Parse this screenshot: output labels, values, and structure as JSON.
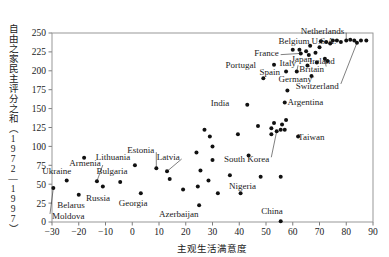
{
  "chart_data": {
    "type": "scatter",
    "title": "",
    "xlabel": "主观生活满意度",
    "ylabel": "自由之家民主评分之和（1972—1997）",
    "xlim": [
      -30,
      90
    ],
    "ylim": [
      0,
      250
    ],
    "xticks": [
      -30,
      -20,
      -10,
      0,
      10,
      20,
      30,
      40,
      50,
      60,
      70,
      80,
      90
    ],
    "xtick_labels": [
      "−30",
      "−20",
      "−10",
      "0",
      "10",
      "20",
      "30",
      "40",
      "50",
      "60",
      "70",
      "80",
      "90"
    ],
    "yticks": [
      0,
      25,
      50,
      75,
      100,
      125,
      150,
      175,
      200,
      225,
      250
    ],
    "ytick_labels": [
      "0",
      "25",
      "50",
      "75",
      "100",
      "125",
      "150",
      "175",
      "200",
      "225",
      "250"
    ],
    "grid": false,
    "legend": "none",
    "marker": "filled-circle",
    "marker_color": "#111111",
    "points": [
      {
        "name": "Moldova",
        "x": -29.5,
        "y": 45,
        "label": "Moldova",
        "label_x": -28.5,
        "label_y": 8,
        "leader": true
      },
      {
        "name": "Ukraine",
        "x": -24.5,
        "y": 55,
        "label": "Ukraine",
        "label_x": -28.0,
        "label_y": 67,
        "leader": false
      },
      {
        "name": "Belarus",
        "x": -20.0,
        "y": 36,
        "label": "Belarus",
        "label_x": -23.0,
        "label_y": 22,
        "leader": false
      },
      {
        "name": "Armenia",
        "x": -13.2,
        "y": 54,
        "label": "Armenia",
        "label_x": -17.0,
        "label_y": 78,
        "leader": true
      },
      {
        "name": "Russia",
        "x": -11.0,
        "y": 47,
        "label": "Russia",
        "label_x": -13.5,
        "label_y": 32,
        "leader": false
      },
      {
        "name": "Bulgaria",
        "x": -4.5,
        "y": 53,
        "label": "Bulgaria",
        "label_x": -7.0,
        "label_y": 67,
        "leader": false
      },
      {
        "name": "Lithuania",
        "x": 1.0,
        "y": 75,
        "label": "Lithuania",
        "label_x": -6.0,
        "label_y": 86,
        "leader": false
      },
      {
        "name": "Georgia",
        "x": 3.2,
        "y": 38,
        "label": "Georgia",
        "label_x": 0.5,
        "label_y": 25,
        "leader": false
      },
      {
        "name": "Estonia",
        "x": 9.0,
        "y": 71,
        "label": "Estonia",
        "label_x": 3.0,
        "label_y": 95,
        "leader": true
      },
      {
        "name": "Latvia",
        "x": 13.0,
        "y": 67,
        "label": "Latvia",
        "label_x": 12.5,
        "label_y": 86,
        "leader": true
      },
      {
        "name": "Azerbaijan",
        "x": 25.0,
        "y": 22,
        "label": "Azerbaijan",
        "label_x": 19.5,
        "label_y": 11,
        "leader": false
      },
      {
        "name": "India",
        "x": 43.0,
        "y": 155,
        "label": "India",
        "label_x": 31.0,
        "label_y": 157,
        "leader": false
      },
      {
        "name": "Nigeria",
        "x": 48.0,
        "y": 60,
        "label": "Nigeria",
        "label_x": 41.0,
        "label_y": 48,
        "leader": false
      },
      {
        "name": "China",
        "x": 55.5,
        "y": 1,
        "label": "China",
        "label_x": 51.0,
        "label_y": 14,
        "leader": false
      },
      {
        "name": "South Korea",
        "x": 54.0,
        "y": 120,
        "label": "South Korea",
        "label_x": 46.0,
        "label_y": 83,
        "leader": true
      },
      {
        "name": "Argentina",
        "x": 57.0,
        "y": 158,
        "label": "Argentina",
        "label_x": 59.5,
        "label_y": 159,
        "leader": false
      },
      {
        "name": "Taiwan",
        "x": 62.0,
        "y": 113,
        "label": "Taiwan",
        "label_x": 63.5,
        "label_y": 112,
        "leader": false
      },
      {
        "name": "Portugal",
        "x": 53.0,
        "y": 208,
        "label": "Portugal",
        "label_x": 41.0,
        "label_y": 208,
        "leader": false
      },
      {
        "name": "Spain",
        "x": 57.5,
        "y": 199,
        "label": "Spain",
        "label_x": 50.0,
        "label_y": 198,
        "leader": false
      },
      {
        "name": "Italy",
        "x": 61.5,
        "y": 199,
        "label": "Italy",
        "label_x": 56.0,
        "label_y": 210,
        "leader": true
      },
      {
        "name": "France",
        "x": 63.0,
        "y": 223,
        "label": "France",
        "label_x": 49.5,
        "label_y": 224,
        "leader": true
      },
      {
        "name": "Japan",
        "x": 68.5,
        "y": 224,
        "label": "Japan",
        "label_x": 62.0,
        "label_y": 216,
        "leader": false
      },
      {
        "name": "Belgium",
        "x": 70.5,
        "y": 239,
        "label": "Belgium",
        "label_x": 61.0,
        "label_y": 240,
        "leader": false
      },
      {
        "name": "Germany",
        "x": 67.0,
        "y": 193,
        "label": "Germany",
        "label_x": 62.0,
        "label_y": 189,
        "leader": true
      },
      {
        "name": "Britain",
        "x": 72.0,
        "y": 216,
        "label": "Britain",
        "label_x": 66.5,
        "label_y": 203,
        "leader": true
      },
      {
        "name": "Ireland",
        "x": 73.0,
        "y": 213,
        "label": "Ireland",
        "label_x": 70.5,
        "label_y": 213,
        "leader": false
      },
      {
        "name": "U.S.A.",
        "x": 75.0,
        "y": 240,
        "label": "U.S.A.",
        "label_x": 71.0,
        "label_y": 240,
        "leader": false
      },
      {
        "name": "Switzerland",
        "x": 84.0,
        "y": 237,
        "label": "Switzerland",
        "label_x": 72.0,
        "label_y": 180,
        "leader": true
      },
      {
        "name": "Netherlands",
        "x": 80.0,
        "y": 240,
        "label": "Netherlands",
        "label_x": 74.0,
        "label_y": 253,
        "leader": true
      }
    ],
    "unlabeled_points": [
      {
        "x": -18.0,
        "y": 85
      },
      {
        "x": 24.0,
        "y": 92
      },
      {
        "x": 24.5,
        "y": 47
      },
      {
        "x": 19.0,
        "y": 43
      },
      {
        "x": 14.0,
        "y": 57
      },
      {
        "x": 27.0,
        "y": 122
      },
      {
        "x": 29.0,
        "y": 113
      },
      {
        "x": 30.0,
        "y": 82
      },
      {
        "x": 28.5,
        "y": 55
      },
      {
        "x": 32.0,
        "y": 38
      },
      {
        "x": 36.5,
        "y": 62
      },
      {
        "x": 39.5,
        "y": 116
      },
      {
        "x": 40.5,
        "y": 38
      },
      {
        "x": 43.5,
        "y": 88
      },
      {
        "x": 47.0,
        "y": 127
      },
      {
        "x": 52.0,
        "y": 124
      },
      {
        "x": 53.0,
        "y": 131
      },
      {
        "x": 52.0,
        "y": 116
      },
      {
        "x": 55.5,
        "y": 122
      },
      {
        "x": 56.0,
        "y": 129
      },
      {
        "x": 57.0,
        "y": 122
      },
      {
        "x": 55.5,
        "y": 60
      },
      {
        "x": 57.5,
        "y": 135
      },
      {
        "x": 58.0,
        "y": 174
      },
      {
        "x": 60.0,
        "y": 228
      },
      {
        "x": 62.5,
        "y": 228
      },
      {
        "x": 65.0,
        "y": 226
      },
      {
        "x": 66.0,
        "y": 221
      },
      {
        "x": 66.5,
        "y": 233
      },
      {
        "x": 70.0,
        "y": 231
      },
      {
        "x": 72.5,
        "y": 238
      },
      {
        "x": 74.0,
        "y": 236
      },
      {
        "x": 76.5,
        "y": 240
      },
      {
        "x": 78.0,
        "y": 238
      },
      {
        "x": 81.5,
        "y": 241
      },
      {
        "x": 83.0,
        "y": 240
      },
      {
        "x": 85.5,
        "y": 240
      },
      {
        "x": 87.5,
        "y": 240
      },
      {
        "x": 65.5,
        "y": 207
      },
      {
        "x": 69.0,
        "y": 211
      },
      {
        "x": 30.0,
        "y": 100
      },
      {
        "x": 25.5,
        "y": 68
      },
      {
        "x": 49.0,
        "y": 190
      }
    ]
  }
}
